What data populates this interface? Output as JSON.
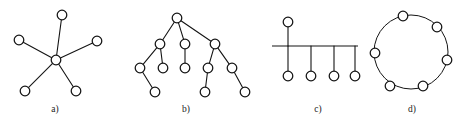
{
  "figure": {
    "width": 469,
    "height": 125,
    "background_color": "#ffffff",
    "stroke_color": "#141414",
    "node_fill_color": "#ffffff",
    "node_radius": 4.8
  },
  "panels": [
    {
      "id": "a",
      "caption": "a)",
      "topology": "star",
      "caption_x": 55,
      "caption_y": 112,
      "node_count": 6,
      "nodes": [
        {
          "name": "center",
          "x": 56,
          "y": 60
        },
        {
          "name": "leaf-top",
          "x": 62,
          "y": 15
        },
        {
          "name": "leaf-left",
          "x": 19,
          "y": 40
        },
        {
          "name": "leaf-right",
          "x": 97,
          "y": 41
        },
        {
          "name": "leaf-bottom-left",
          "x": 25,
          "y": 91
        },
        {
          "name": "leaf-bottom-right",
          "x": 76,
          "y": 91
        }
      ],
      "edges": [
        {
          "from": "center",
          "to": "leaf-top"
        },
        {
          "from": "center",
          "to": "leaf-left"
        },
        {
          "from": "center",
          "to": "leaf-right"
        },
        {
          "from": "center",
          "to": "leaf-bottom-left"
        },
        {
          "from": "center",
          "to": "leaf-bottom-right"
        }
      ]
    },
    {
      "id": "b",
      "caption": "b)",
      "topology": "tree",
      "caption_x": 186,
      "caption_y": 112,
      "node_count": 12,
      "nodes": [
        {
          "name": "root",
          "x": 177,
          "y": 18
        },
        {
          "name": "child-1",
          "x": 160,
          "y": 44
        },
        {
          "name": "child-2",
          "x": 185,
          "y": 44
        },
        {
          "name": "child-3",
          "x": 215,
          "y": 44
        },
        {
          "name": "grand-1",
          "x": 140,
          "y": 68
        },
        {
          "name": "grand-2",
          "x": 163,
          "y": 68
        },
        {
          "name": "grand-3",
          "x": 185,
          "y": 68
        },
        {
          "name": "grand-4",
          "x": 208,
          "y": 68
        },
        {
          "name": "grand-5",
          "x": 232,
          "y": 68
        },
        {
          "name": "leaf-1",
          "x": 155,
          "y": 92
        },
        {
          "name": "leaf-2",
          "x": 205,
          "y": 92
        },
        {
          "name": "leaf-3",
          "x": 245,
          "y": 92
        }
      ],
      "edges": [
        {
          "from": "root",
          "to": "child-1"
        },
        {
          "from": "root",
          "to": "child-2"
        },
        {
          "from": "root",
          "to": "child-3"
        },
        {
          "from": "child-1",
          "to": "grand-1"
        },
        {
          "from": "child-1",
          "to": "grand-2"
        },
        {
          "from": "child-2",
          "to": "grand-3"
        },
        {
          "from": "child-3",
          "to": "grand-4"
        },
        {
          "from": "child-3",
          "to": "grand-5"
        },
        {
          "from": "grand-1",
          "to": "leaf-1"
        },
        {
          "from": "grand-4",
          "to": "leaf-2"
        },
        {
          "from": "grand-5",
          "to": "leaf-3"
        }
      ]
    },
    {
      "id": "c",
      "caption": "c)",
      "topology": "bus",
      "caption_x": 318,
      "caption_y": 112,
      "node_count": 5,
      "bus_line": {
        "x1": 272,
        "x2": 358,
        "y": 46
      },
      "nodes": [
        {
          "name": "bus-node-top",
          "x": 288,
          "y": 22
        },
        {
          "name": "bus-node-1",
          "x": 288,
          "y": 76
        },
        {
          "name": "bus-node-2",
          "x": 311,
          "y": 76
        },
        {
          "name": "bus-node-3",
          "x": 334,
          "y": 76
        },
        {
          "name": "bus-node-4",
          "x": 355,
          "y": 76
        }
      ],
      "edges": [
        {
          "from": "bus-node-top",
          "to": "bus"
        },
        {
          "from": "bus-node-1",
          "to": "bus"
        },
        {
          "from": "bus-node-2",
          "to": "bus"
        },
        {
          "from": "bus-node-3",
          "to": "bus"
        },
        {
          "from": "bus-node-4",
          "to": "bus"
        }
      ]
    },
    {
      "id": "d",
      "caption": "d)",
      "topology": "ring",
      "caption_x": 412,
      "caption_y": 112,
      "node_count": 7,
      "ring": {
        "cx": 411,
        "cy": 52,
        "rx": 37,
        "ry": 37
      },
      "nodes": [
        {
          "name": "ring-node-1",
          "x": 403,
          "y": 16
        },
        {
          "name": "ring-node-2",
          "x": 437,
          "y": 27
        },
        {
          "name": "ring-node-3",
          "x": 447,
          "y": 60
        },
        {
          "name": "ring-node-4",
          "x": 423,
          "y": 86
        },
        {
          "name": "ring-node-5",
          "x": 390,
          "y": 86
        },
        {
          "name": "ring-node-6",
          "x": 375,
          "y": 53
        },
        {
          "name": "ring-node-7",
          "x": 403,
          "y": 16
        }
      ]
    }
  ]
}
